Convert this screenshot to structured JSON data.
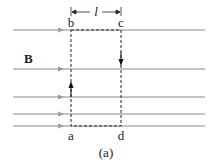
{
  "diagram": {
    "caption": "(a)",
    "field_label": "B",
    "width_label": "l",
    "corners": {
      "a": "a",
      "b": "b",
      "c": "c",
      "d": "d"
    },
    "colors": {
      "field_line": "#8a8a8a",
      "loop": "#222222",
      "text": "#222222"
    },
    "field_lines_y": [
      30,
      69,
      97,
      114,
      126
    ],
    "loop": {
      "x_left": 71,
      "x_right": 121,
      "y_top": 30,
      "y_bottom": 126
    }
  }
}
